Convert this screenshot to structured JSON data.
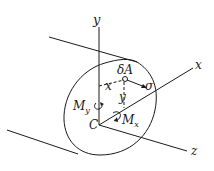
{
  "diagram": {
    "type": "beam-cross-section-bending",
    "colors": {
      "ink": "#1a1a1a",
      "background": "#ffffff"
    },
    "labels": {
      "y_axis": "y",
      "x_axis": "x",
      "z_axis": "z",
      "centroid": "C",
      "area_element": "δA",
      "stress": "σ",
      "x_distance": "x",
      "y_distance": "y",
      "moment_y": "M",
      "moment_y_sub": "y",
      "moment_x": "M",
      "moment_x_sub": "x"
    }
  }
}
